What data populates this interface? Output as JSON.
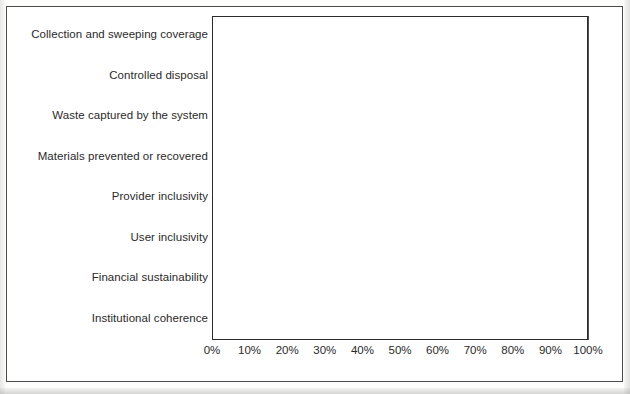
{
  "chart_data": {
    "type": "bar",
    "orientation": "horizontal",
    "title": "",
    "xlabel": "",
    "ylabel": "",
    "xlim": [
      0,
      100
    ],
    "grid": true,
    "legend": false,
    "categories": [
      "Collection and sweeping coverage",
      "Controlled disposal",
      "Waste captured by the system",
      "Materials prevented or recovered",
      "Provider inclusivity",
      "User inclusivity",
      "Financial sustainability",
      "Institutional coherence"
    ],
    "values": [
      100,
      100,
      95,
      0,
      50,
      60,
      50,
      83
    ],
    "xticks": [
      0,
      10,
      20,
      30,
      40,
      50,
      60,
      70,
      80,
      90,
      100
    ],
    "xticklabels": [
      "0%",
      "10%",
      "20%",
      "30%",
      "40%",
      "50%",
      "60%",
      "70%",
      "80%",
      "90%",
      "100%"
    ]
  },
  "style": {
    "bar_fill": "#d9d9d9",
    "bar_border": "#222222",
    "grid_color": "#4f4f4f",
    "frame_color": "#2b2b2b",
    "outer_frame_color": "#4a4a4a",
    "text_color": "#2a2a2a",
    "background": "#ffffff"
  }
}
